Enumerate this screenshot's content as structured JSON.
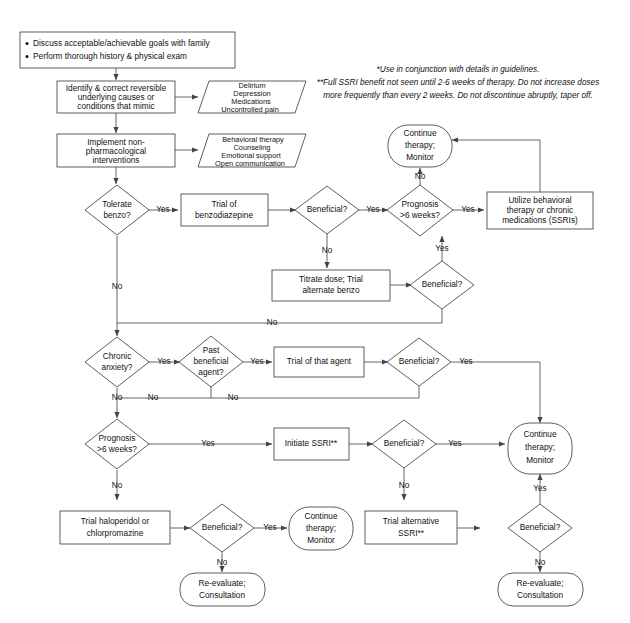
{
  "notes": {
    "line1": "*Use in conjunction with details in guidelines.",
    "line2": "**Full SSRI benefit not seen until 2-6 weeks of therapy.  Do not increase doses",
    "line3": "more frequently than every 2 weeks.  Do not discontinue abruptly, taper off."
  },
  "start": {
    "bullets": [
      "Discuss acceptable/achievable goals with family",
      "Perform thorough history & physical exam"
    ]
  },
  "nodes": {
    "identify": {
      "lines": [
        "Identify & correct reversible",
        "underlying causes or",
        "conditions that mimic"
      ]
    },
    "mimic_list": {
      "lines": [
        "Delirium",
        "Depression",
        "Medications",
        "Uncontrolled pain"
      ]
    },
    "implement": {
      "lines": [
        "Implement non-",
        "pharmacological",
        "interventions"
      ]
    },
    "nonpharm_list": {
      "lines": [
        "Behavioral therapy",
        "Counseling",
        "Emotional support",
        "Open communication"
      ]
    },
    "tolerate_benzo": {
      "lines": [
        "Tolerate",
        "benzo?"
      ]
    },
    "trial_benzo": {
      "lines": [
        "Trial of",
        "benzodiazepine"
      ]
    },
    "beneficial_1": {
      "lines": [
        "Beneficial?"
      ]
    },
    "prognosis_1": {
      "lines": [
        "Prognosis",
        ">6 weeks?"
      ]
    },
    "continue_1": {
      "lines": [
        "Continue",
        "therapy;",
        "Monitor"
      ]
    },
    "utilize": {
      "lines": [
        "Utilize behavioral",
        "therapy or chronic",
        "medications (SSRIs)"
      ]
    },
    "titrate": {
      "lines": [
        "Titrate dose; Trial",
        "alternate benzo"
      ]
    },
    "beneficial_2": {
      "lines": [
        "Beneficial?"
      ]
    },
    "chronic_anxiety": {
      "lines": [
        "Chronic",
        "anxiety?"
      ]
    },
    "past_agent": {
      "lines": [
        "Past",
        "beneficial",
        "agent?"
      ]
    },
    "trial_agent": {
      "lines": [
        "Trial of that agent"
      ]
    },
    "beneficial_3": {
      "lines": [
        "Beneficial?"
      ]
    },
    "prognosis_2": {
      "lines": [
        "Prognosis",
        ">6 weeks?"
      ]
    },
    "initiate_ssri": {
      "lines": [
        "Initiate SSRI**"
      ]
    },
    "beneficial_4": {
      "lines": [
        "Beneficial?"
      ]
    },
    "continue_2": {
      "lines": [
        "Continue",
        "therapy;",
        "Monitor"
      ]
    },
    "trial_halo": {
      "lines": [
        "Trial haloperidol or",
        "chlorpromazine"
      ]
    },
    "beneficial_5": {
      "lines": [
        "Beneficial?"
      ]
    },
    "continue_3": {
      "lines": [
        "Continue",
        "therapy;",
        "Monitor"
      ]
    },
    "reeval_1": {
      "lines": [
        "Re-evaluate;",
        "Consultation"
      ]
    },
    "trial_alt_ssri": {
      "lines": [
        "Trial alternative",
        "SSRI**"
      ]
    },
    "beneficial_6": {
      "lines": [
        "Beneficial?"
      ]
    },
    "reeval_2": {
      "lines": [
        "Re-evaluate;",
        "Consultation"
      ]
    }
  },
  "edge_labels": {
    "yes": "Yes",
    "no": "No"
  },
  "colors": {
    "stroke": "#4d4d4d",
    "connector": "#555555",
    "text": "#111111",
    "background": "#ffffff"
  }
}
